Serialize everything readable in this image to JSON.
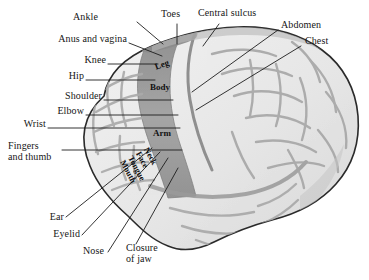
{
  "colors": {
    "background": "#ffffff",
    "brain_light": "#ececec",
    "brain_light_2": "#f4f4f4",
    "brain_mid": "#cfcfcf",
    "sulcus_line": "#9a9a9a",
    "motor_strip": "#9d9d9d",
    "motor_strip_dark": "#8a8a8a",
    "outline": "#2b2b2b",
    "leader_line": "#1d1d1d",
    "text": "#161616"
  },
  "callouts": [
    {
      "id": "ankle",
      "label": "Ankle",
      "align": "right",
      "x": 96,
      "y": 17
    },
    {
      "id": "toes",
      "label": "Toes",
      "align": "left",
      "x": 165,
      "y": 14
    },
    {
      "id": "central-sulcus",
      "label": "Central sulcus",
      "align": "left",
      "x": 200,
      "y": 13
    },
    {
      "id": "abdomen",
      "label": "Abdomen",
      "align": "left",
      "x": 280,
      "y": 25
    },
    {
      "id": "anus-and-vagina",
      "label": "Anus and vagina",
      "align": "right",
      "x": 43,
      "y": 39
    },
    {
      "id": "chest",
      "label": "Chest",
      "align": "left",
      "x": 303,
      "y": 41
    },
    {
      "id": "knee",
      "label": "Knee",
      "align": "right",
      "x": 82,
      "y": 60
    },
    {
      "id": "hip",
      "label": "Hip",
      "align": "right",
      "x": 63,
      "y": 76
    },
    {
      "id": "shoulder",
      "label": "Shoulder",
      "align": "right",
      "x": 52,
      "y": 96
    },
    {
      "id": "elbow",
      "label": "Elbow",
      "align": "right",
      "x": 43,
      "y": 111
    },
    {
      "id": "wrist",
      "label": "Wrist",
      "align": "right",
      "x": 16,
      "y": 124
    },
    {
      "id": "fingers-thumb",
      "label": "Fingers\nand thumb",
      "align": "right",
      "x": 16,
      "y": 145
    },
    {
      "id": "ear",
      "label": "Ear",
      "align": "right",
      "x": 60,
      "y": 219
    },
    {
      "id": "eyelid",
      "label": "Eyelid",
      "align": "right",
      "x": 50,
      "y": 237
    },
    {
      "id": "nose",
      "label": "Nose",
      "align": "right",
      "x": 75,
      "y": 254
    },
    {
      "id": "closure-of-jaw",
      "label": "Closure\nof jaw",
      "align": "left",
      "x": 128,
      "y": 248
    }
  ],
  "region_labels": [
    {
      "id": "leg",
      "label": "Leg",
      "x": 156,
      "y": 68,
      "rotate": -22
    },
    {
      "id": "body",
      "label": "Body",
      "x": 152,
      "y": 87,
      "rotate": 0
    },
    {
      "id": "arm",
      "label": "Arm",
      "x": 154,
      "y": 133,
      "rotate": 0
    }
  ],
  "strip_stack": {
    "x": 150,
    "y": 147,
    "rotate": 62,
    "items": [
      {
        "id": "neck",
        "label": "Neck"
      },
      {
        "id": "face",
        "label": "Face"
      },
      {
        "id": "tongue",
        "label": "Tongue"
      },
      {
        "id": "mouth",
        "label": "Mouth"
      }
    ]
  }
}
